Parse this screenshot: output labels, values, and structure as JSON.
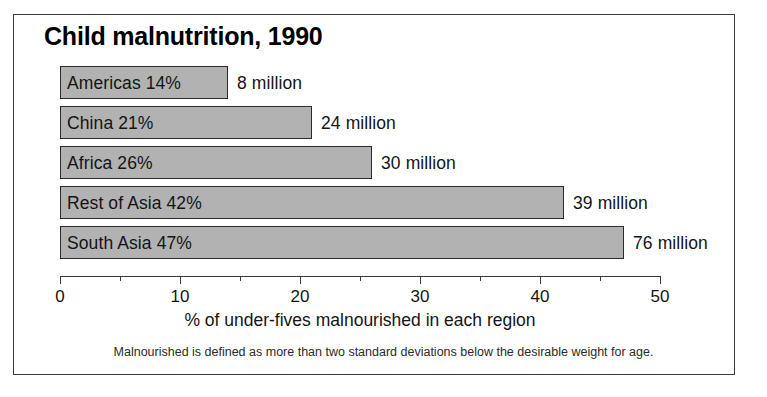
{
  "chart_data": {
    "type": "bar",
    "orientation": "horizontal",
    "title": "Child malnutrition, 1990",
    "xlabel": "% of under-fives malnourished in each region",
    "ylabel": "",
    "xlim": [
      0,
      50
    ],
    "grid": false,
    "legend": null,
    "xticks": [
      0,
      10,
      20,
      30,
      40,
      50
    ],
    "xtick_labels": [
      "0",
      "10",
      "20",
      "30",
      "40",
      "50"
    ],
    "minor_tick_step": 5,
    "categories": [
      "Americas",
      "China",
      "Africa",
      "Rest of Asia",
      "South Asia"
    ],
    "values": [
      14,
      21,
      26,
      42,
      47
    ],
    "bar_labels": [
      "Americas 14%",
      "China 21%",
      "Africa 26%",
      "Rest of Asia 42%",
      "South Asia 47%"
    ],
    "annotations": [
      "8 million",
      "24 million",
      "30 million",
      "39 million",
      "76 million"
    ],
    "counts_millions": [
      8,
      24,
      30,
      39,
      76
    ],
    "footnote": "Malnourished is defined as more than two standard deviations below the desirable weight for age.",
    "colors": {
      "bar_fill": "#b2b2b2",
      "bar_border": "#2b2b2b",
      "axis": "#3a3a3a",
      "text": "#141414",
      "background": "#ffffff",
      "frame_border": "#3a3a3a"
    }
  }
}
